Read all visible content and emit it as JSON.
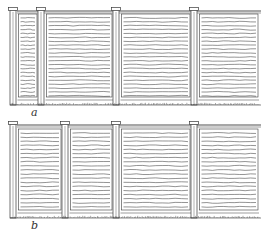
{
  "figure": {
    "type": "patent-style line drawing",
    "ink_color": "#3a3a3a",
    "background_color": "#ffffff",
    "views": [
      {
        "label": "a",
        "post_count": 4,
        "panel_count": 4,
        "panels": [
          "narrow",
          "wide",
          "wide",
          "wide (cropped at right edge)"
        ]
      },
      {
        "label": "b",
        "post_count": 4,
        "panel_count": 4,
        "panels": [
          "medium",
          "medium",
          "wide",
          "wide (cropped at right edge)"
        ]
      }
    ]
  }
}
